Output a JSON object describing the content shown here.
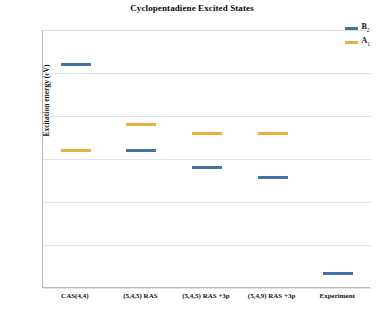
{
  "chart_data": {
    "type": "scatter",
    "title": "Cyclopentadiene Excited States",
    "xlabel": "",
    "ylabel": "Excitation energy (eV)",
    "ylim": [
      5,
      8
    ],
    "yticks": [
      "5",
      "5.5",
      "6",
      "6.5",
      "7",
      "7.5",
      "8"
    ],
    "grid": true,
    "legend_position": "top-right",
    "categories": [
      "CAS(4,4)",
      "(5,4,5) RAS",
      "(5,4,5) RAS +3p",
      "(5,4,9) RAS +3p",
      "Experiment"
    ],
    "series": [
      {
        "name": "B2",
        "label_base": "B",
        "label_sub": "2",
        "color": "#4472a4",
        "values": [
          7.6,
          6.6,
          6.4,
          6.28,
          5.17
        ]
      },
      {
        "name": "A1",
        "label_base": "A",
        "label_sub": "1",
        "color": "#e8b13c",
        "values": [
          6.6,
          6.9,
          6.8,
          6.8,
          null
        ]
      }
    ]
  }
}
